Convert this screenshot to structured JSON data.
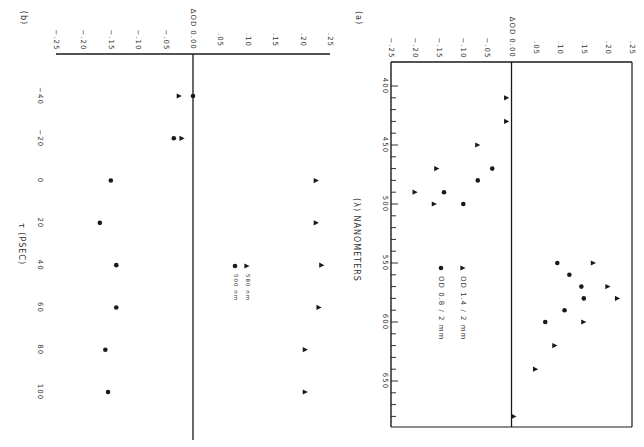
{
  "figure": {
    "orientation": "rotated 90 degrees clockwise",
    "ink_color": "#1a1a1a",
    "background": "#ffffff"
  },
  "chart_data": [
    {
      "panel_label": "(a)",
      "type": "scatter",
      "title": "",
      "xlabel": "(λ) NANOMETERS",
      "ylabel": "ΔOD",
      "x_ticks": [
        "400",
        "450",
        "500",
        "550",
        "600",
        "650"
      ],
      "x_tick_values": [
        400,
        450,
        500,
        550,
        600,
        650
      ],
      "xlim": [
        375,
        685
      ],
      "y_ticks": [
        "−.25",
        "−.20",
        "−.15",
        "−.10",
        "−.05",
        "0.00",
        ".05",
        ".10",
        ".15",
        ".20",
        ".25"
      ],
      "y_tick_values": [
        -0.25,
        -0.2,
        -0.15,
        -0.1,
        -0.05,
        0,
        0.05,
        0.1,
        0.15,
        0.2,
        0.25
      ],
      "ylim": [
        -0.25,
        0.25
      ],
      "zero_line": true,
      "grid": false,
      "legend_position": "lower-left (rotated)",
      "series": [
        {
          "name": "OD 1.4 / 2 mm",
          "marker": "triangle",
          "points": [
            [
              410,
              -0.01
            ],
            [
              430,
              -0.01
            ],
            [
              450,
              -0.07
            ],
            [
              470,
              -0.155
            ],
            [
              490,
              -0.2
            ],
            [
              500,
              -0.16
            ],
            [
              550,
              0.17
            ],
            [
              570,
              0.2
            ],
            [
              580,
              0.22
            ],
            [
              600,
              0.15
            ],
            [
              620,
              0.09
            ],
            [
              640,
              0.05
            ],
            [
              680,
              0.005
            ]
          ]
        },
        {
          "name": "OD 0.8 / 2 mm",
          "marker": "circle",
          "points": [
            [
              470,
              -0.04
            ],
            [
              480,
              -0.07
            ],
            [
              490,
              -0.14
            ],
            [
              500,
              -0.1
            ],
            [
              550,
              0.095
            ],
            [
              560,
              0.12
            ],
            [
              570,
              0.145
            ],
            [
              580,
              0.15
            ],
            [
              590,
              0.11
            ],
            [
              600,
              0.07
            ]
          ]
        }
      ],
      "legend": [
        {
          "marker": "▲",
          "label": "OD  1.4 / 2 mm"
        },
        {
          "marker": "●",
          "label": "OD  0.8 / 2 mm"
        }
      ]
    },
    {
      "panel_label": "(b)",
      "type": "scatter",
      "title": "",
      "xlabel": "τ (PSEC)",
      "ylabel": "ΔOD",
      "x_ticks": [
        "−40",
        "−20",
        "0",
        "20",
        "40",
        "60",
        "80",
        "100"
      ],
      "x_tick_values": [
        -40,
        -20,
        0,
        20,
        40,
        60,
        80,
        100
      ],
      "xlim": [
        -52,
        122
      ],
      "y_ticks": [
        "−.25",
        "−.20",
        "−.15",
        "−.10",
        "−.05",
        "0.00",
        ".05",
        ".10",
        ".15",
        ".20",
        ".25"
      ],
      "y_tick_values": [
        -0.25,
        -0.2,
        -0.15,
        -0.1,
        -0.05,
        0,
        0.05,
        0.1,
        0.15,
        0.2,
        0.25
      ],
      "ylim": [
        -0.25,
        0.25
      ],
      "zero_line": true,
      "grid": false,
      "legend_position": "center-right (rotated)",
      "series": [
        {
          "name": "580 nm",
          "marker": "triangle",
          "points": [
            [
              -40,
              -0.025
            ],
            [
              -20,
              -0.02
            ],
            [
              0,
              0.225
            ],
            [
              20,
              0.225
            ],
            [
              40,
              0.235
            ],
            [
              60,
              0.23
            ],
            [
              80,
              0.205
            ],
            [
              100,
              0.205
            ]
          ]
        },
        {
          "name": "500 nm",
          "marker": "circle",
          "points": [
            [
              -40,
              0.0
            ],
            [
              -20,
              -0.035
            ],
            [
              0,
              -0.15
            ],
            [
              20,
              -0.17
            ],
            [
              40,
              -0.14
            ],
            [
              60,
              -0.14
            ],
            [
              80,
              -0.16
            ],
            [
              100,
              -0.155
            ]
          ]
        }
      ],
      "legend": [
        {
          "marker": "▲",
          "label": "580 nm"
        },
        {
          "marker": "●",
          "label": "500 nm"
        }
      ]
    }
  ]
}
